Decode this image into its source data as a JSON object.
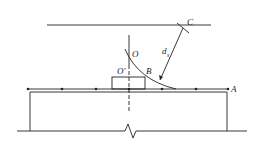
{
  "diagram": {
    "labels": {
      "C": "C",
      "O": "O",
      "O_prime": "O′",
      "B": "B",
      "A": "A",
      "d": "d",
      "d_sub": "s"
    },
    "colors": {
      "stroke": "#222222",
      "background": "#ffffff"
    }
  }
}
